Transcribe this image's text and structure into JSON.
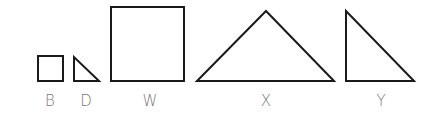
{
  "diagram": {
    "stroke_color": "#1a1a1a",
    "label_color": "#777777",
    "shapes": [
      {
        "id": "B",
        "type": "square",
        "label": "B",
        "x": 38,
        "y": 56,
        "w": 25,
        "h": 25,
        "label_x": 50
      },
      {
        "id": "D",
        "type": "right-triangle",
        "label": "D",
        "points": "74,57 74,81 99,81",
        "label_x": 86
      },
      {
        "id": "W",
        "type": "square",
        "label": "W",
        "x": 111,
        "y": 7,
        "w": 73,
        "h": 74,
        "label_x": 150
      },
      {
        "id": "X",
        "type": "isosceles-triangle",
        "label": "X",
        "points": "197,81 266,11 334,81",
        "label_x": 266
      },
      {
        "id": "Y",
        "type": "right-triangle",
        "label": "Y",
        "points": "346,11 346,81 414,81",
        "label_x": 380
      }
    ],
    "labels": {
      "B": "B",
      "D": "D",
      "W": "W",
      "X": "X",
      "Y": "Y"
    }
  }
}
